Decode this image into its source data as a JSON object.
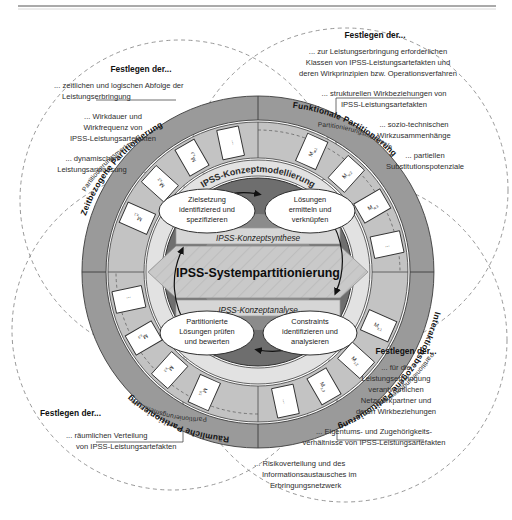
{
  "figure": {
    "title": "IPSS-Systempartitionierung",
    "top_rule": true
  },
  "core": {
    "center_label": "IPSS-Systempartitionierung",
    "band_top": "IPSS-Konzeptsynthese",
    "band_bottom": "IPSS-Konzeptanalyse",
    "ring_label": "IPSS-Konzeptmodellierung",
    "activities": [
      {
        "id": "top-left",
        "lines": [
          "Zielsetzung",
          "identifiziered und",
          "spezifizieren"
        ]
      },
      {
        "id": "top-right",
        "lines": [
          "Lösungen",
          "ermitteln und",
          "verknüpfen"
        ]
      },
      {
        "id": "bottom-left",
        "lines": [
          "Partitionierte",
          "Lösungen prüfen",
          "und bewerten"
        ]
      },
      {
        "id": "bottom-right",
        "lines": [
          "Constraints",
          "identifizieren und",
          "analysieren"
        ]
      }
    ]
  },
  "quadrants": [
    {
      "id": "zeitbezogen",
      "ring_label": "Zeitbezogene Partitionierung",
      "criteria_label": "Partitionierungsmerkmale",
      "criteria_items": [
        "M x,1",
        "M x,2",
        "M x,3",
        "..."
      ],
      "callout_header": "Festlegen der...",
      "callout_items": [
        "... zeitlichen und logischen Abfolge der Leistungserbringung",
        "... Wirkdauer und Wirkfrequenz von IPSS-Leistungsartefakten",
        "... dynamischen Leistungsanpassung"
      ]
    },
    {
      "id": "funktional",
      "ring_label": "Funktionale Partitionierung",
      "criteria_label": "Partitionierungsmerkmale",
      "criteria_items": [
        "M w,1",
        "M w,2",
        "M w,3",
        "..."
      ],
      "callout_header": "Festlegen der...",
      "callout_items": [
        "... zur Leistungserbringung erforderlichen Klassen von IPSS-Leistungsartefakten und deren Wirkprinzipien bzw. Operationsverfahren",
        "... strukturellen Wirkbeziehungen von IPSS-Leistungsartefakten",
        "... sozio-technischen Wirkzusammenhänge",
        "... partiellen Substitutionspotenziale"
      ]
    },
    {
      "id": "raeumlich",
      "ring_label": "Räumliche Partitionierung",
      "criteria_label": "Partitionierungsmerkmale",
      "criteria_items": [
        "M y,1",
        "M y,2",
        "M y,3",
        "..."
      ],
      "callout_header": "Festlegen der...",
      "callout_items": [
        "... räumlichen Verteilung von IPSS-Leistungsartefakten"
      ]
    },
    {
      "id": "interaktionsbezogen",
      "ring_label": "Interaktionsbezogene Partitionierung",
      "criteria_label": "Partitionierungsmerkmale",
      "criteria_items": [
        "M z,1",
        "M z,2",
        "M z,3",
        "..."
      ],
      "callout_header": "Festlegen der...",
      "callout_items": [
        "... für die Leistungserbringung verantwortlichen Netzwerkpartner und deren Wirkbeziehungen",
        "... Eigentums- und Zugehörigkeits- verhältnisse von IPSS-Leistungsartefakten",
        "... Risikoverteilung und des Informationsaustausches im Erbringungsnetzwerk"
      ]
    }
  ],
  "callout_text": {
    "tl_header": "Festlegen der...",
    "tl_l1a": "... zeitlichen und logischen Abfolge der",
    "tl_l1b": "Leistungserbringung",
    "tl_l2a": "... Wirkdauer und",
    "tl_l2b": "Wirkfrequenz von",
    "tl_l2c": "IPSS-Leistungsartefakten",
    "tl_l3a": "... dynamischen",
    "tl_l3b": "Leistungsanpassung",
    "tr_header": "Festlegen der...",
    "tr_l1a": "... zur Leistungserbringung erforderlichen",
    "tr_l1b": "Klassen von IPSS-Leistungsartefakten und",
    "tr_l1c": "deren Wirkprinzipien bzw. Operationsverfahren",
    "tr_l2a": "... strukturellen Wirkbeziehungen von",
    "tr_l2b": "IPSS-Leistungsartefakten",
    "tr_l3a": "... sozio-technischen",
    "tr_l3b": "Wirkzusammenhänge",
    "tr_l4a": "... partiellen",
    "tr_l4b": "Substitutionspotenziale",
    "bl_header": "Festlegen der...",
    "bl_l1a": "... räumlichen Verteilung",
    "bl_l1b": "von IPSS-Leistungsartefakten",
    "br_header": "Festlegen der...",
    "br_l1a": "... für die",
    "br_l1b": "Leistungserbringung",
    "br_l1c": "verantwortlichen",
    "br_l1d": "Netzwerkpartner und",
    "br_l1e": "deren Wirkbeziehungen",
    "br_l2a": "... Eigentums- und Zugehörigkeits-",
    "br_l2b": "verhältnisse von IPSS-Leistungsartefakten",
    "br_l3a": "... Risikoverteilung und des",
    "br_l3b": "Informationsaustausches im",
    "br_l3c": "Erbringungsnetzwerk"
  },
  "colors": {
    "background": "#ffffff",
    "outer_ring": "#9a9a9a",
    "criteria_ring": "#b8b8b8",
    "inner_ring_light": "#d8d8d8",
    "core_dark": "#6e6e6e",
    "arrow_grey": "#b0b0b0",
    "band_grey": "#d2d2d2",
    "ellipse_fill": "#ffffff",
    "stroke": "#333333",
    "text": "#2b2b2b"
  },
  "geometry": {
    "cx": 258,
    "cy": 272,
    "r_outer_ring_out": 176,
    "r_outer_ring_in": 152,
    "r_criteria_out": 150,
    "r_criteria_in": 114,
    "r_konz_out": 112,
    "r_konz_in": 96,
    "r_core_out": 94,
    "r_core_in": 58
  }
}
